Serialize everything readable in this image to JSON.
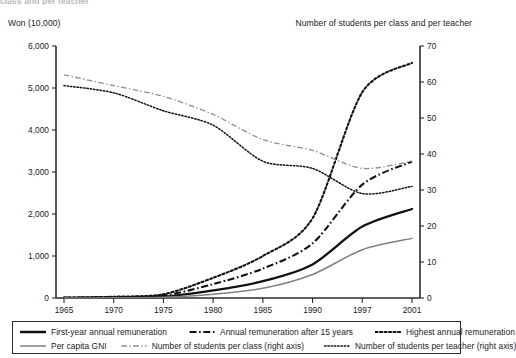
{
  "clipped_caption": "class and per teacher",
  "axis_captions": {
    "left": "Won (10,000)",
    "right": "Number of students per class and per teacher"
  },
  "legend": {
    "rows": [
      [
        {
          "label": "First-year annual remuneration",
          "style": "solid-thick-black",
          "color": "#111111"
        },
        {
          "label": "Annual remuneration after 15 years",
          "style": "dashdot-black",
          "color": "#111111"
        },
        {
          "label": "Highest annual  remuneration",
          "style": "dotted-black",
          "color": "#111111"
        }
      ],
      [
        {
          "label": "Per capita GNI",
          "style": "solid-thin-gray",
          "color": "#808080"
        },
        {
          "label": "Number of students per class (right axis)",
          "style": "dashed-gray",
          "color": "#8e8e8e"
        },
        {
          "label": "Number of students per teacher (right axis)",
          "style": "fine-dotted-black",
          "color": "#111111"
        }
      ]
    ]
  },
  "chart_data": {
    "type": "line",
    "title": "",
    "xlabel": "",
    "ylabel": "Won (10,000)",
    "y2label": "Number of students per class and per teacher",
    "grid": false,
    "legend_position": "bottom",
    "x": [
      "1965",
      "1970",
      "1975",
      "1980",
      "1985",
      "1990",
      "1997",
      "2001"
    ],
    "xtick_labels": [
      "1965",
      "1970",
      "1975",
      "1980",
      "1985",
      "1990",
      "1997",
      "2001"
    ],
    "ylim": [
      0,
      6000
    ],
    "ytick_labels": [
      "0",
      "1,000",
      "2,000",
      "3,000",
      "4,000",
      "5,000",
      "6,000"
    ],
    "yticks": [
      0,
      1000,
      2000,
      3000,
      4000,
      5000,
      6000
    ],
    "y2lim": [
      0,
      70
    ],
    "y2tick_labels": [
      "0",
      "10",
      "20",
      "30",
      "40",
      "50",
      "60",
      "70"
    ],
    "y2ticks": [
      0,
      10,
      20,
      30,
      40,
      50,
      60,
      70
    ],
    "series": [
      {
        "name": "First-year annual remuneration",
        "axis": "left",
        "style": "solid-thick-black",
        "color": "#111111",
        "values": [
          2,
          10,
          30,
          180,
          400,
          800,
          1700,
          2120
        ]
      },
      {
        "name": "Annual remuneration after 15 years",
        "axis": "left",
        "style": "dashdot-black",
        "color": "#111111",
        "values": [
          5,
          20,
          60,
          330,
          700,
          1300,
          2700,
          3250
        ]
      },
      {
        "name": "Highest annual  remuneration",
        "axis": "left",
        "style": "dotted-black",
        "color": "#111111",
        "values": [
          8,
          30,
          90,
          480,
          1000,
          1900,
          4900,
          5600
        ]
      },
      {
        "name": "Per capita GNI",
        "axis": "left",
        "style": "solid-thin-gray",
        "color": "#808080",
        "values": [
          1,
          5,
          20,
          90,
          230,
          560,
          1150,
          1420
        ]
      },
      {
        "name": "Number of students per class (right axis)",
        "axis": "right",
        "style": "dashed-gray",
        "color": "#8e8e8e",
        "values": [
          62,
          59,
          56,
          51,
          44,
          41,
          36,
          38
        ]
      },
      {
        "name": "Number of students per teacher (right axis)",
        "axis": "right",
        "style": "fine-dotted-black",
        "color": "#111111",
        "values": [
          59,
          57,
          52,
          48,
          38,
          36,
          29,
          31
        ]
      }
    ]
  }
}
